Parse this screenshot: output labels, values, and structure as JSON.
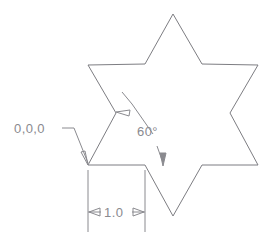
{
  "drawing": {
    "title": "Six-pointed star dimensioned sketch",
    "background_color": "#ffffff",
    "line_color": "#7d7d82",
    "text_color": "#8a8a8f",
    "line_width": 1
  },
  "labels": {
    "origin": "0,0,0",
    "angle": "60°",
    "length": "1.0"
  },
  "annotations": {
    "origin_leader": {
      "name": "origin-leader",
      "text_anchor": [
        14,
        133
      ],
      "polyline": "62,128 74,128 88,163",
      "arrow_tip": [
        88,
        165
      ]
    },
    "angle_leader_upper": {
      "name": "angle-leader-upper",
      "polyline": "153,134 132,104",
      "arrow_tip": [
        116,
        112
      ],
      "tick": "122,92 132,104"
    },
    "angle_leader_lower": {
      "name": "angle-leader-lower",
      "polyline": "157,146 162,160",
      "arrow_tip": [
        163,
        166
      ]
    },
    "dimension": {
      "name": "linear-dimension-1-0",
      "extension_left": "88,170 88,232",
      "extension_right": "145,170 145,232",
      "dim_line_y": 212,
      "dim_line_left": "88,212 101,212",
      "dim_line_right": "132,212 145,212",
      "arrow_left_tip": [
        89,
        212
      ],
      "arrow_right_tip": [
        144,
        212
      ],
      "text_anchor": [
        116,
        217
      ]
    }
  },
  "geometry": {
    "star_name": "hexagram-outline",
    "points": [
      [
        173,
        14
      ],
      [
        202,
        64
      ],
      [
        258,
        65
      ],
      [
        230,
        113
      ],
      [
        258,
        165
      ],
      [
        202,
        165
      ],
      [
        173,
        216
      ],
      [
        145,
        165
      ],
      [
        88,
        165
      ],
      [
        116,
        113
      ],
      [
        88,
        65
      ],
      [
        145,
        64
      ]
    ],
    "baseline": {
      "name": "baseline-segment",
      "from": [
        88,
        165
      ],
      "to": [
        202,
        165
      ]
    }
  }
}
